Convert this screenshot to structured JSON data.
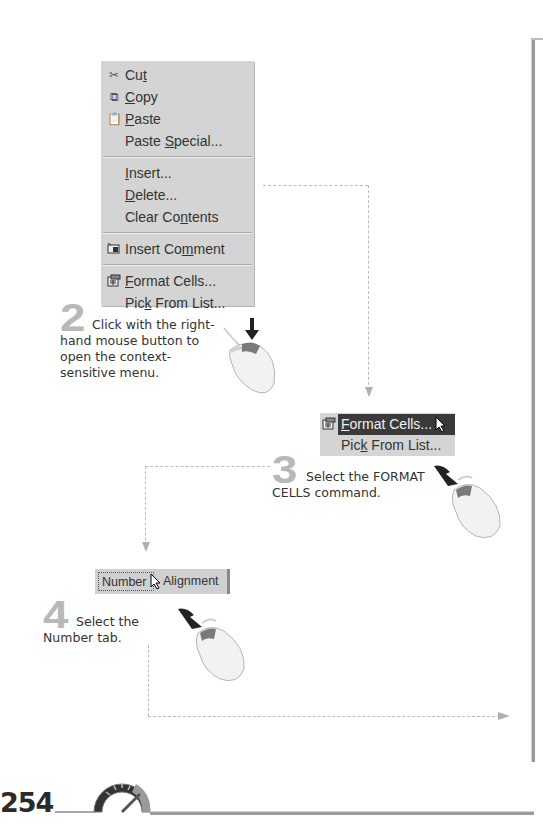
{
  "context_menu": {
    "items": [
      {
        "icon": "scissors-icon",
        "pre": "Cu",
        "u": "t",
        "post": ""
      },
      {
        "icon": "copy-icon",
        "pre": "",
        "u": "C",
        "post": "opy"
      },
      {
        "icon": "paste-icon",
        "pre": "",
        "u": "P",
        "post": "aste"
      },
      {
        "icon": "",
        "pre": "Paste ",
        "u": "S",
        "post": "pecial..."
      },
      {
        "sep": true
      },
      {
        "icon": "",
        "pre": "",
        "u": "I",
        "post": "nsert..."
      },
      {
        "icon": "",
        "pre": "",
        "u": "D",
        "post": "elete..."
      },
      {
        "icon": "",
        "pre": "Clear Co",
        "u": "n",
        "post": "tents"
      },
      {
        "sep": true
      },
      {
        "icon": "comment-icon",
        "pre": "Insert Co",
        "u": "m",
        "post": "ment"
      },
      {
        "sep": true
      },
      {
        "icon": "format-cells-icon",
        "pre": "",
        "u": "F",
        "post": "ormat Cells..."
      },
      {
        "icon": "",
        "pre": "Pic",
        "u": "k",
        "post": " From List..."
      }
    ]
  },
  "steps": [
    {
      "number": "2",
      "text": "Click with the right-hand mouse button to open the context-sensitive menu."
    },
    {
      "number": "3",
      "text": "Select the FORMAT CELLS command."
    },
    {
      "number": "4",
      "text": "Select the Number tab."
    }
  ],
  "step2": {
    "number": "2",
    "line1": "Click with the right-",
    "line2": "hand mouse button to",
    "line3": "open the context-",
    "line4": "sensitive menu."
  },
  "step3": {
    "number": "3",
    "line1": "Select the FORMAT",
    "line2": "CELLS command."
  },
  "step4": {
    "number": "4",
    "line1": "Select the",
    "line2": "Number tab."
  },
  "mini_menu": {
    "format_cells": {
      "u": "F",
      "post": "ormat Cells..."
    },
    "pick_from_list": {
      "pre": "Pic",
      "u": "k",
      "post": " From List..."
    }
  },
  "tabs": {
    "number": "Number",
    "alignment": "Alignment"
  },
  "footer": {
    "page_number": "254"
  },
  "colors": {
    "menu_bg": "#d4d4d4",
    "highlight": "#3a3a3a",
    "step_number": "#b8b8b8",
    "dash": "#bcbcbc"
  }
}
